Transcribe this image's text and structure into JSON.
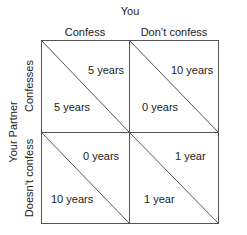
{
  "title": "You",
  "row_title": "Your Partner",
  "columns": [
    {
      "label": "Confess"
    },
    {
      "label": "Don’t confess"
    }
  ],
  "rows": [
    {
      "label": "Confesses"
    },
    {
      "label": "Doesn’t confess"
    }
  ],
  "cells": [
    [
      {
        "you": "5 years",
        "partner": "5 years"
      },
      {
        "you": "10 years",
        "partner": "0 years"
      }
    ],
    [
      {
        "you": "0 years",
        "partner": "10 years"
      },
      {
        "you": "1 year",
        "partner": "1 year"
      }
    ]
  ],
  "colors": {
    "line": "#555555",
    "text": "#222222"
  }
}
